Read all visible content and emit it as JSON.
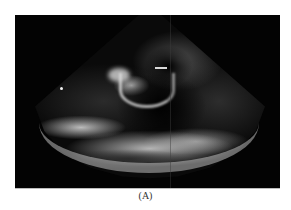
{
  "figure": {
    "type": "echocardiogram",
    "view": "parasternal long-axis ultrasound",
    "caption": "(A)",
    "colors": {
      "background": "#ffffff",
      "frame": "#030303",
      "echo_bright": "#e6e6e6",
      "caption_text": "#333333"
    }
  }
}
